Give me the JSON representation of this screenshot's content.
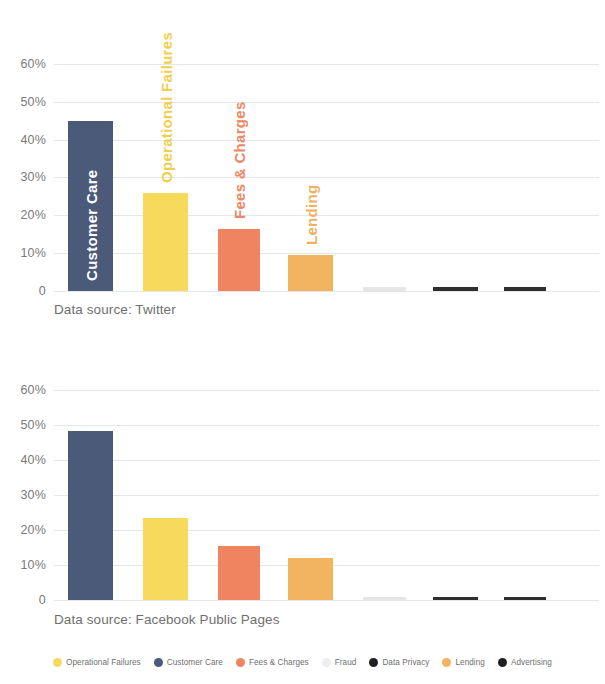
{
  "chart_data": [
    {
      "type": "bar",
      "title": "",
      "source_label": "Data source: Twitter",
      "xlabel": "",
      "ylabel": "",
      "ylim": [
        0,
        65
      ],
      "grid": true,
      "yticks": [
        "60%",
        "50%",
        "40%",
        "30%",
        "20%",
        "10%",
        "0"
      ],
      "ytick_values": [
        60,
        50,
        40,
        30,
        20,
        10,
        0
      ],
      "categories": [
        "Customer Care",
        "Operational Failures",
        "Fees & Charges",
        "Lending",
        "Fraud",
        "Data Privacy",
        "Advertising"
      ],
      "values": [
        45,
        26,
        16.5,
        9.5,
        1,
        1,
        1
      ],
      "colors": [
        "#4a5a78",
        "#f7d95c",
        "#f08460",
        "#f2b45e",
        "#e6e6e6",
        "#2e2e2e",
        "#2e2e2e"
      ],
      "bar_labels": [
        "Customer Care",
        "Operational Failures",
        "Fees & Charges",
        "Lending",
        "",
        "",
        ""
      ],
      "bar_label_colors": [
        "#ffffff",
        "#f0cf4e",
        "#ef8763",
        "#eeb25f",
        "",
        "",
        ""
      ]
    },
    {
      "type": "bar",
      "title": "",
      "source_label": "Data source: Facebook Public Pages",
      "xlabel": "",
      "ylabel": "",
      "ylim": [
        0,
        65
      ],
      "grid": true,
      "yticks": [
        "60%",
        "50%",
        "40%",
        "30%",
        "20%",
        "10%",
        "0"
      ],
      "ytick_values": [
        60,
        50,
        40,
        30,
        20,
        10,
        0
      ],
      "categories": [
        "Customer Care",
        "Operational Failures",
        "Fees & Charges",
        "Lending",
        "Fraud",
        "Data Privacy",
        "Advertising"
      ],
      "values": [
        48.5,
        23.5,
        15.5,
        12,
        1,
        1,
        1
      ],
      "colors": [
        "#4a5a78",
        "#f7d95c",
        "#f08460",
        "#f2b45e",
        "#e6e6e6",
        "#2e2e2e",
        "#2e2e2e"
      ],
      "bar_labels": [
        "",
        "",
        "",
        "",
        "",
        "",
        ""
      ],
      "bar_label_colors": [
        "",
        "",
        "",
        "",
        "",
        "",
        ""
      ]
    }
  ],
  "legend": {
    "items": [
      {
        "label": "Operational Failures",
        "color": "#f7d95c"
      },
      {
        "label": "Customer Care",
        "color": "#4a5a78"
      },
      {
        "label": "Fees & Charges",
        "color": "#f08460"
      },
      {
        "label": "Fraud",
        "color": "#ededed"
      },
      {
        "label": "Data Privacy",
        "color": "#1f1f1f"
      },
      {
        "label": "Lending",
        "color": "#f2b45e"
      },
      {
        "label": "Advertising",
        "color": "#1f1f1f"
      }
    ]
  }
}
